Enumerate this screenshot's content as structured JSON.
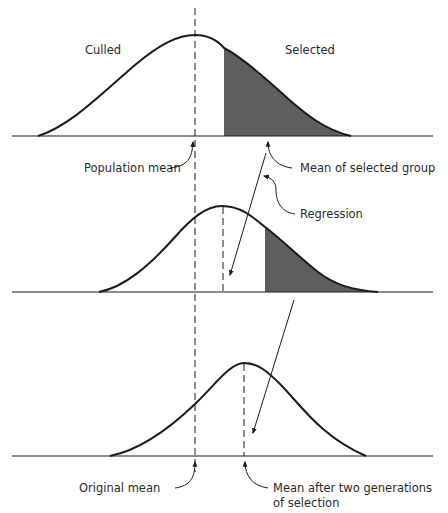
{
  "diagram": {
    "title": "",
    "colors": {
      "line": "#1a1a1a",
      "shade": "#5e5e5e",
      "text": "#2a2a2a",
      "background": "#ffffff"
    },
    "panels": [
      {
        "name": "generation-0",
        "labels": {
          "left": "Culled",
          "right": "Selected",
          "mean_left": "Population mean",
          "mean_right": "Mean of selected group"
        }
      },
      {
        "name": "generation-1",
        "labels": {
          "regression": "Regression"
        }
      },
      {
        "name": "generation-2",
        "labels": {
          "mean_left": "Original mean",
          "mean_right_line1": "Mean after two generations",
          "mean_right_line2": "of selection"
        }
      }
    ]
  }
}
